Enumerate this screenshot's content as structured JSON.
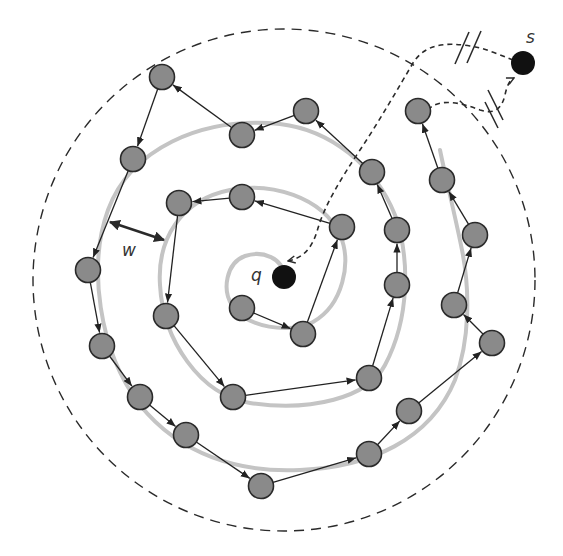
{
  "diagram": {
    "labels": {
      "source": "s",
      "query": "q",
      "width": "w"
    },
    "colors": {
      "node_fill": "#8a8a8a",
      "node_stroke": "#2a2a2a",
      "endpoint_fill": "#111111",
      "spiral": "#c4c4c4",
      "edge": "#222222"
    },
    "query_point": {
      "x": 284,
      "y": 277
    },
    "source_point": {
      "x": 523,
      "y": 63
    },
    "range_circle": {
      "cx": 284,
      "cy": 280,
      "r": 251
    },
    "nodes": [
      {
        "id": 1,
        "x": 242,
        "y": 308
      },
      {
        "id": 2,
        "x": 303,
        "y": 334
      },
      {
        "id": 3,
        "x": 342,
        "y": 227
      },
      {
        "id": 4,
        "x": 242,
        "y": 197
      },
      {
        "id": 5,
        "x": 179,
        "y": 203
      },
      {
        "id": 6,
        "x": 166,
        "y": 316
      },
      {
        "id": 7,
        "x": 233,
        "y": 397
      },
      {
        "id": 8,
        "x": 369,
        "y": 378
      },
      {
        "id": 9,
        "x": 397,
        "y": 285
      },
      {
        "id": 10,
        "x": 397,
        "y": 230
      },
      {
        "id": 11,
        "x": 372,
        "y": 172
      },
      {
        "id": 12,
        "x": 306,
        "y": 111
      },
      {
        "id": 13,
        "x": 242,
        "y": 135
      },
      {
        "id": 14,
        "x": 162,
        "y": 77
      },
      {
        "id": 15,
        "x": 133,
        "y": 159
      },
      {
        "id": 16,
        "x": 88,
        "y": 270
      },
      {
        "id": 17,
        "x": 102,
        "y": 346
      },
      {
        "id": 18,
        "x": 140,
        "y": 397
      },
      {
        "id": 19,
        "x": 186,
        "y": 435
      },
      {
        "id": 20,
        "x": 261,
        "y": 486
      },
      {
        "id": 21,
        "x": 369,
        "y": 454
      },
      {
        "id": 22,
        "x": 409,
        "y": 411
      },
      {
        "id": 23,
        "x": 492,
        "y": 343
      },
      {
        "id": 24,
        "x": 454,
        "y": 305
      },
      {
        "id": 25,
        "x": 475,
        "y": 235
      },
      {
        "id": 26,
        "x": 442,
        "y": 180
      },
      {
        "id": 27,
        "x": 418,
        "y": 111
      }
    ],
    "edges": [
      [
        1,
        2
      ],
      [
        2,
        3
      ],
      [
        3,
        4
      ],
      [
        4,
        5
      ],
      [
        5,
        6
      ],
      [
        6,
        7
      ],
      [
        7,
        8
      ],
      [
        8,
        9
      ],
      [
        9,
        10
      ],
      [
        10,
        11
      ],
      [
        11,
        12
      ],
      [
        12,
        13
      ],
      [
        13,
        14
      ],
      [
        14,
        15
      ],
      [
        15,
        16
      ],
      [
        16,
        17
      ],
      [
        17,
        18
      ],
      [
        18,
        19
      ],
      [
        19,
        20
      ],
      [
        20,
        21
      ],
      [
        21,
        22
      ],
      [
        22,
        23
      ],
      [
        23,
        24
      ],
      [
        24,
        25
      ],
      [
        25,
        26
      ],
      [
        26,
        27
      ]
    ]
  }
}
